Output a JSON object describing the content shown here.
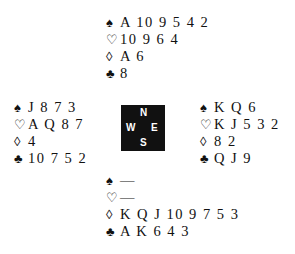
{
  "suits": {
    "spade": "♠",
    "heart": "♡",
    "diamond": "◊",
    "club": "♣"
  },
  "compass": {
    "north": "N",
    "west": "W",
    "east": "E",
    "south": "S"
  },
  "hands": {
    "north": {
      "spades": "A 10 9 5 4 2",
      "hearts": "10 9 6 4",
      "diamonds": "A 6",
      "clubs": "8"
    },
    "west": {
      "spades": "J 8 7 3",
      "hearts": "A Q 8 7",
      "diamonds": "4",
      "clubs": "10 7 5 2"
    },
    "east": {
      "spades": "K Q 6",
      "hearts": "K J 5 3 2",
      "diamonds": "8 2",
      "clubs": "Q J 9"
    },
    "south": {
      "spades": "—",
      "hearts": "—",
      "diamonds": "K Q J 10 9 7 5 3",
      "clubs": "A K 6 4 3"
    }
  }
}
